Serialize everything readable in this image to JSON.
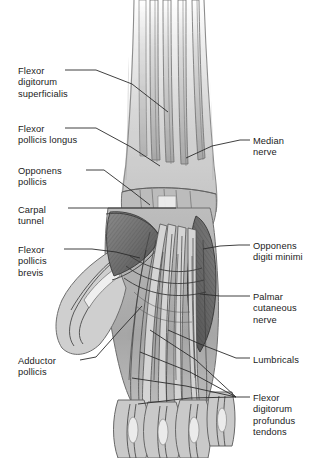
{
  "figure": {
    "view": "palmar (volar) view of right forearm, wrist and hand with skin and palmar fascia removed",
    "background_color": "#ffffff",
    "text_color": "#1b1b1b",
    "leader_color": "#2b2b2b"
  },
  "labels_left": [
    {
      "id": "flexor-digitorum-superficialis",
      "lines": [
        "Flexor",
        "digitorum",
        "superficialis"
      ],
      "x": 18,
      "y": 66,
      "dash": {
        "x1": 65,
        "y1": 70,
        "x2": 96,
        "y2": 70
      },
      "leader": [
        [
          96,
          70
        ],
        [
          132,
          84
        ],
        [
          168,
          112
        ]
      ]
    },
    {
      "id": "flexor-pollicis-longus",
      "lines": [
        "Flexor",
        "pollicis longus"
      ],
      "x": 18,
      "y": 124,
      "dash": {
        "x1": 65,
        "y1": 128,
        "x2": 96,
        "y2": 128
      },
      "leader": [
        [
          96,
          128
        ],
        [
          131,
          147
        ],
        [
          160,
          166
        ]
      ]
    },
    {
      "id": "opponens-pollicis",
      "lines": [
        "Opponens",
        "pollicis"
      ],
      "x": 18,
      "y": 166,
      "dash": {
        "x1": 86,
        "y1": 170,
        "x2": 104,
        "y2": 170
      },
      "leader": [
        [
          104,
          170
        ],
        [
          132,
          191
        ],
        [
          150,
          205
        ]
      ]
    },
    {
      "id": "carpal-tunnel",
      "lines": [
        "Carpal",
        "tunnel"
      ],
      "x": 18,
      "y": 205,
      "dash": {
        "x1": 68,
        "y1": 208,
        "x2": 100,
        "y2": 208
      },
      "leader": [
        [
          100,
          208
        ],
        [
          146,
          208
        ],
        [
          176,
          208
        ]
      ]
    },
    {
      "id": "flexor-pollicis-brevis",
      "lines": [
        "Flexor",
        "pollicis",
        "brevis"
      ],
      "x": 18,
      "y": 245,
      "dash": {
        "x1": 64,
        "y1": 249,
        "x2": 92,
        "y2": 249
      },
      "leader": [
        [
          92,
          249
        ],
        [
          116,
          252
        ],
        [
          140,
          258
        ]
      ]
    },
    {
      "id": "adductor-pollicis",
      "lines": [
        "Adductor",
        "pollicis"
      ],
      "x": 18,
      "y": 356,
      "dash": {
        "x1": 80,
        "y1": 360,
        "x2": 96,
        "y2": 357
      },
      "leader": [
        [
          96,
          357
        ],
        [
          120,
          330
        ],
        [
          142,
          306
        ]
      ]
    }
  ],
  "labels_right": [
    {
      "id": "median-nerve",
      "lines": [
        "Median",
        "nerve"
      ],
      "x": 253,
      "y": 136,
      "dash": {
        "x1": 240,
        "y1": 140,
        "x2": 250,
        "y2": 140
      },
      "leader": [
        [
          240,
          140
        ],
        [
          212,
          146
        ],
        [
          186,
          158
        ]
      ]
    },
    {
      "id": "opponens-digiti-minimi",
      "lines": [
        "Opponens",
        "digiti minimi"
      ],
      "x": 253,
      "y": 241,
      "dash": {
        "x1": 239,
        "y1": 245,
        "x2": 250,
        "y2": 245
      },
      "leader": [
        [
          239,
          245
        ],
        [
          220,
          246
        ],
        [
          203,
          249
        ]
      ]
    },
    {
      "id": "palmar-cutaneous-nerve",
      "lines": [
        "Palmar",
        "cutaneous",
        "nerve"
      ],
      "x": 253,
      "y": 292,
      "dash": {
        "x1": 239,
        "y1": 296,
        "x2": 250,
        "y2": 296
      },
      "leader": [
        [
          239,
          296
        ],
        [
          220,
          296
        ],
        [
          200,
          294
        ]
      ]
    },
    {
      "id": "lumbricals",
      "lines": [
        "Lumbricals"
      ],
      "x": 253,
      "y": 355,
      "dash": {
        "x1": 236,
        "y1": 358,
        "x2": 250,
        "y2": 358
      },
      "leader": [
        [
          236,
          358
        ],
        [
          200,
          344
        ],
        [
          168,
          330
        ]
      ]
    },
    {
      "id": "flexor-digitorum-profundus-tendons",
      "lines": [
        "Flexor",
        "digitorum",
        "profundus",
        "tendons"
      ],
      "x": 253,
      "y": 393,
      "dash": {
        "x1": 236,
        "y1": 397,
        "x2": 250,
        "y2": 397
      },
      "fan": [
        [
          [
            236,
            397
          ],
          [
            196,
            360
          ],
          [
            150,
            330
          ]
        ],
        [
          [
            236,
            397
          ],
          [
            190,
            372
          ],
          [
            140,
            352
          ]
        ],
        [
          [
            236,
            397
          ],
          [
            186,
            386
          ],
          [
            132,
            378
          ]
        ],
        [
          [
            236,
            397
          ],
          [
            190,
            398
          ],
          [
            138,
            404
          ]
        ]
      ]
    }
  ],
  "anatomy_regions": [
    {
      "id": "forearm-shaft",
      "tone": "#d9d9d9",
      "note": "distal forearm, fades to white at top"
    },
    {
      "id": "flexor-tendon-bundle",
      "tone": "#b4b4b4",
      "note": "long parallel flexor tendons descending to wrist"
    },
    {
      "id": "thenar-muscle-mass",
      "tone": "#6d6d6d",
      "note": "opponens pollicis / flexor pollicis brevis"
    },
    {
      "id": "hypothenar-muscle-mass",
      "tone": "#5f5f5f",
      "note": "opponens digiti minimi"
    },
    {
      "id": "carpal-tunnel-region",
      "tone": "#8a8a8a",
      "note": "tendons crossing beneath flexor retinaculum"
    },
    {
      "id": "palmar-tendon-fan",
      "tone": "#9a9a9a",
      "note": "profundus and superficialis tendons fanning to digits"
    },
    {
      "id": "thumb",
      "tone": "#cfcfcf",
      "note": "thumb projecting laterally, left side"
    },
    {
      "id": "digits",
      "tone": "#c8c8c8",
      "note": "four finger stumps cropped at lower border"
    }
  ]
}
